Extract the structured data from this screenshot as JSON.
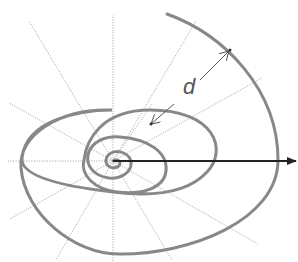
{
  "diagram": {
    "type": "logarithmic-spiral",
    "center": [
      113,
      161
    ],
    "spiral_color": "#888888",
    "ray_color": "#aaaaaa",
    "axis_color": "#222222",
    "labels": {
      "distance": "d"
    },
    "rays_deg": [
      0,
      30,
      60,
      90,
      120,
      150,
      180,
      210,
      240,
      270,
      300,
      330
    ]
  }
}
